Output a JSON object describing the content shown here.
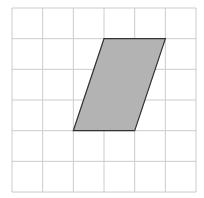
{
  "diagram": {
    "type": "grid-with-parallelogram",
    "grid": {
      "columns": 6,
      "rows": 6,
      "origin_px": [
        12,
        8
      ],
      "cell_w": 30.67,
      "cell_h": 30.67,
      "line_color": "#cccccc"
    },
    "shape": {
      "name": "parallelogram",
      "vertices_grid": [
        [
          3,
          1
        ],
        [
          5,
          1
        ],
        [
          4,
          4
        ],
        [
          2,
          4
        ]
      ],
      "fill": "#b3b3b3",
      "stroke": "#333333",
      "base_units": 2,
      "height_units": 3
    }
  }
}
